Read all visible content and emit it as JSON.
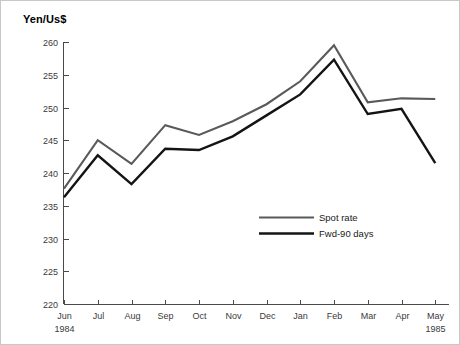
{
  "chart_data": {
    "type": "line",
    "title": "Yen/Us$",
    "xlabel": "",
    "ylabel": "Yen/Us$",
    "ylim": [
      220,
      260
    ],
    "ytick_labels": [
      "220",
      "225",
      "230",
      "235",
      "240",
      "245",
      "250",
      "255",
      "260"
    ],
    "yticks": [
      220,
      225,
      230,
      235,
      240,
      245,
      250,
      255,
      260
    ],
    "grid": false,
    "legend_position": "center-right-inside",
    "categories": [
      "Jun",
      "Jul",
      "Aug",
      "Sep",
      "Oct",
      "Nov",
      "Dec",
      "Jan",
      "Feb",
      "Mar",
      "Apr",
      "May"
    ],
    "category_sublabels": [
      "1984",
      "",
      "",
      "",
      "",
      "",
      "",
      "",
      "",
      "",
      "",
      "1985"
    ],
    "series": [
      {
        "name": "Spot rate",
        "color": "#5a5a5a",
        "values": [
          237.6,
          245.0,
          241.4,
          247.3,
          245.8,
          247.9,
          250.5,
          254.0,
          259.5,
          250.8,
          251.4,
          251.3
        ]
      },
      {
        "name": "Fwd-90 days",
        "color": "#141414",
        "values": [
          236.3,
          242.7,
          238.3,
          243.7,
          243.5,
          245.6,
          248.8,
          252.0,
          257.3,
          249.0,
          249.8,
          241.5
        ]
      }
    ]
  },
  "legend": {
    "entries": [
      {
        "label": "Spot rate"
      },
      {
        "label": "Fwd-90 days"
      }
    ]
  }
}
